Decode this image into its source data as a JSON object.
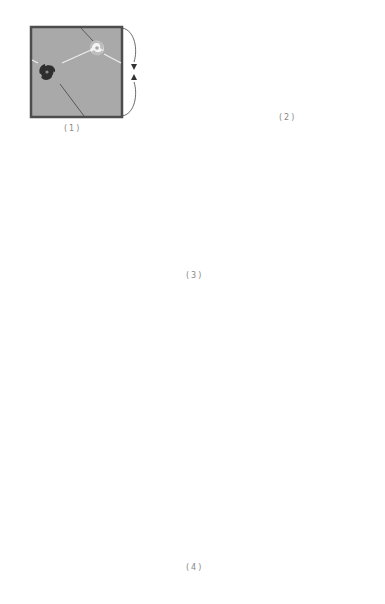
{
  "figure": {
    "panels": [
      {
        "id": 1,
        "label": "(1)",
        "shape": "square",
        "description": "square with opposite edges identified"
      },
      {
        "id": 2,
        "label": "(2)",
        "shape": "cylinder"
      },
      {
        "id": 3,
        "label": "(3)",
        "shape": "torus"
      },
      {
        "id": 4,
        "label": "(4)",
        "shape": "tiled-plane"
      }
    ],
    "icons": {
      "light_vortex": "white-spiral-icon",
      "dark_vortex": "dark-spiral-icon"
    },
    "colors": {
      "surface": "#a9a9a9",
      "border": "#4d4d4d",
      "dark_vortex": "#333333",
      "light_vortex": "#f2f2f2",
      "arrow_light": "#eeeeee",
      "arrow_dark": "#444444",
      "caption": "#888888"
    },
    "grid": {
      "rows": 4,
      "cols": 5
    }
  }
}
